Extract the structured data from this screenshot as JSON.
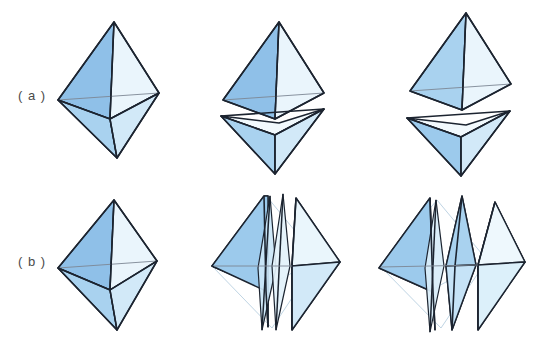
{
  "figure": {
    "background_color": "#ffffff",
    "rows": [
      {
        "id": "row-a",
        "label": "( a )",
        "label_x": 18,
        "label_y": 96,
        "description": "Octahedron split horizontally into two square pyramids",
        "panels": [
          {
            "id": "a1",
            "caption": "",
            "state": "assembled"
          },
          {
            "id": "a2",
            "caption": "",
            "state": "slightly-separated"
          },
          {
            "id": "a3",
            "caption": "",
            "state": "fully-separated"
          }
        ]
      },
      {
        "id": "row-b",
        "label": "( b )",
        "label_x": 18,
        "label_y": 262,
        "description": "Octahedron split vertically into wedge slices",
        "panels": [
          {
            "id": "b1",
            "caption": "",
            "state": "assembled"
          },
          {
            "id": "b2",
            "caption": "",
            "state": "slightly-separated"
          },
          {
            "id": "b3",
            "caption": "",
            "state": "fully-separated"
          }
        ]
      }
    ]
  },
  "palette": {
    "edge": "#1c2430",
    "hidden_edge": "#7d8794",
    "ghost_edge": "#b8cfe0",
    "face_dark_blue": "#8fc0e8",
    "face_mid_blue": "#a9d2ef",
    "face_light_blue": "#cbe6f7",
    "face_pale_blue": "#e6f3fb",
    "face_palest": "#f0f8fd",
    "label_text": "#4a4a4a",
    "background": "#ffffff"
  },
  "geometry": {
    "octahedron_a1": {
      "top": [
        114,
        22
      ],
      "bottom": [
        117,
        158
      ],
      "left": [
        58,
        100
      ],
      "right": [
        159,
        93
      ],
      "front": [
        110,
        119
      ],
      "back": [
        106,
        76
      ]
    },
    "octahedron_b1": {
      "top": [
        114,
        200
      ],
      "bottom": [
        117,
        330
      ],
      "left": [
        58,
        268
      ],
      "right": [
        157,
        261
      ],
      "front": [
        110,
        290
      ],
      "back": [
        106,
        245
      ]
    }
  }
}
